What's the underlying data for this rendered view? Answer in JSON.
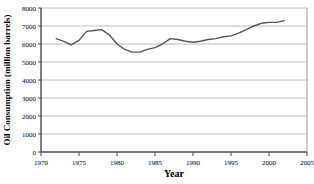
{
  "chart_data": {
    "type": "line",
    "title": "",
    "xlabel": "Year",
    "ylabel": "Oil Consumption (million barrels)",
    "xlim": [
      1970,
      2005
    ],
    "ylim": [
      0,
      8000
    ],
    "xticks": [
      1970,
      1975,
      1980,
      1985,
      1990,
      1995,
      2000,
      2005
    ],
    "xtick_labels": [
      "1970",
      "1975",
      "1980",
      "1985",
      "1990",
      "1995",
      "2000",
      "2005"
    ],
    "yticks": [
      0,
      1000,
      2000,
      3000,
      4000,
      5000,
      6000,
      7000,
      8000
    ],
    "ytick_labels": [
      "0",
      "1000",
      "2000",
      "3000",
      "4000",
      "5000",
      "6000",
      "7000",
      "8000"
    ],
    "grid": "horizontal",
    "legend": "none",
    "line_color": "#555555",
    "x": [
      1972,
      1973,
      1974,
      1975,
      1976,
      1977,
      1978,
      1979,
      1980,
      1981,
      1982,
      1983,
      1984,
      1985,
      1986,
      1987,
      1988,
      1989,
      1990,
      1991,
      1992,
      1993,
      1994,
      1995,
      1996,
      1997,
      1998,
      1999,
      2000,
      2001,
      2002
    ],
    "values": [
      6300,
      6150,
      5950,
      6200,
      6700,
      6750,
      6800,
      6500,
      6000,
      5700,
      5550,
      5550,
      5700,
      5800,
      6000,
      6300,
      6250,
      6150,
      6100,
      6150,
      6250,
      6300,
      6400,
      6450,
      6600,
      6800,
      7000,
      7150,
      7200,
      7200,
      7300
    ],
    "series_name": "Oil Consumption"
  }
}
